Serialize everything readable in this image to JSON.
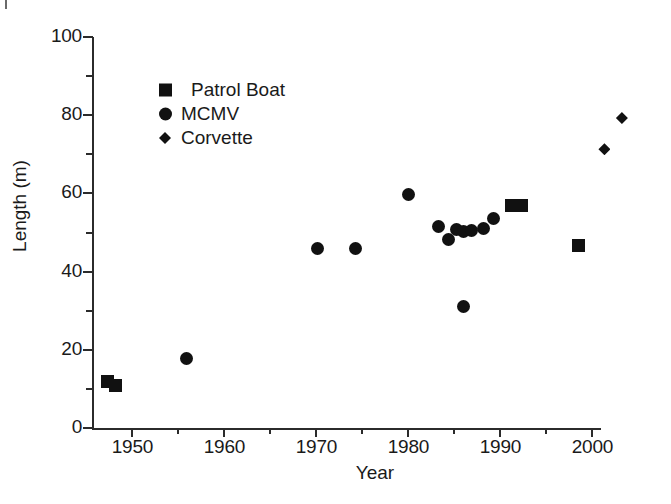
{
  "chart_data": {
    "type": "scatter",
    "title": "",
    "xlabel": "Year",
    "ylabel": "Length (m)",
    "xlim": [
      1945.6,
      2001.0
    ],
    "ylim": [
      0,
      100
    ],
    "xticks": [
      1950,
      1960,
      1970,
      1980,
      1990,
      2000
    ],
    "xtick_labels": [
      "1950",
      "1960",
      "1970",
      "1980",
      "1990",
      "2000"
    ],
    "x_minor_ticks": [
      1955,
      1965,
      1975,
      1985,
      1995
    ],
    "yticks": [
      0,
      20,
      40,
      60,
      80,
      100
    ],
    "ytick_labels": [
      "0",
      "20",
      "40",
      "60",
      "80",
      "100"
    ],
    "y_minor_ticks": [
      10,
      30,
      50,
      70,
      90
    ],
    "grid": false,
    "legend_position": "upper left",
    "marker_color": "#111111",
    "axis_color": "#2b2b2b",
    "series": [
      {
        "name": "Patrol Boat",
        "marker": "square",
        "points": [
          {
            "x": 1947.3,
            "y": 12.0
          },
          {
            "x": 1948.2,
            "y": 10.8
          },
          {
            "x": 1991.2,
            "y": 56.9
          },
          {
            "x": 1992.3,
            "y": 56.9
          },
          {
            "x": 1998.5,
            "y": 46.6
          }
        ]
      },
      {
        "name": "MCMV",
        "marker": "circle",
        "points": [
          {
            "x": 1955.9,
            "y": 17.8
          },
          {
            "x": 1970.1,
            "y": 45.9
          },
          {
            "x": 1974.2,
            "y": 45.9
          },
          {
            "x": 1980.0,
            "y": 59.8
          },
          {
            "x": 1983.3,
            "y": 51.5
          },
          {
            "x": 1984.3,
            "y": 48.2
          },
          {
            "x": 1985.2,
            "y": 50.8
          },
          {
            "x": 1986.0,
            "y": 50.2
          },
          {
            "x": 1986.0,
            "y": 31.0
          },
          {
            "x": 1986.9,
            "y": 50.5
          },
          {
            "x": 1988.2,
            "y": 51.0
          },
          {
            "x": 1989.2,
            "y": 53.6
          }
        ]
      },
      {
        "name": "Corvette",
        "marker": "diamond",
        "points": [
          {
            "x": 2001.3,
            "y": 71.3
          },
          {
            "x": 2003.2,
            "y": 79.3
          }
        ]
      }
    ]
  },
  "legend": {
    "entries": [
      {
        "label": "Patrol Boat",
        "marker": "square",
        "icon": "square-marker-icon"
      },
      {
        "label": "MCMV",
        "marker": "circle",
        "icon": "circle-marker-icon"
      },
      {
        "label": "Corvette",
        "marker": "diamond",
        "icon": "diamond-marker-icon"
      }
    ]
  }
}
